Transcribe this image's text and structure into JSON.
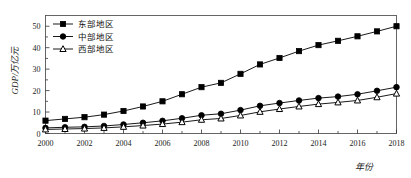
{
  "chart_data": {
    "type": "line",
    "title": "",
    "xlabel": "年份",
    "ylabel": "GDP/万亿元",
    "x": [
      2000,
      2001,
      2002,
      2003,
      2004,
      2005,
      2006,
      2007,
      2008,
      2009,
      2010,
      2011,
      2012,
      2013,
      2014,
      2015,
      2016,
      2017,
      2018
    ],
    "xtick_labels": [
      "2000",
      "2002",
      "2004",
      "2006",
      "2008",
      "2010",
      "2012",
      "2014",
      "2016",
      "2018"
    ],
    "xtick_values": [
      2000,
      2002,
      2004,
      2006,
      2008,
      2010,
      2012,
      2014,
      2016,
      2018
    ],
    "ytick_labels": [
      "0",
      "10",
      "20",
      "30",
      "40",
      "50"
    ],
    "ytick_values": [
      0,
      10,
      20,
      30,
      40,
      50
    ],
    "xlim": [
      2000,
      2018
    ],
    "ylim": [
      0,
      55
    ],
    "grid": false,
    "legend_position": "top-left",
    "series": [
      {
        "name": "东部地区",
        "marker": "square",
        "color": "#000000",
        "values": [
          6.0,
          6.8,
          7.6,
          8.8,
          10.5,
          12.6,
          15.0,
          18.3,
          21.6,
          23.6,
          27.8,
          32.2,
          35.2,
          38.4,
          41.2,
          43.2,
          45.3,
          47.6,
          50.0
        ]
      },
      {
        "name": "中部地区",
        "marker": "circle",
        "color": "#000000",
        "values": [
          2.6,
          2.9,
          3.1,
          3.5,
          4.2,
          5.0,
          5.9,
          7.1,
          8.5,
          9.2,
          10.9,
          12.9,
          14.2,
          15.4,
          16.5,
          17.2,
          18.3,
          19.9,
          21.6
        ]
      },
      {
        "name": "西部地区",
        "marker": "triangle",
        "color": "#000000",
        "values": [
          1.9,
          2.1,
          2.3,
          2.6,
          3.1,
          3.7,
          4.4,
          5.3,
          6.4,
          7.0,
          8.4,
          10.1,
          11.4,
          12.6,
          13.7,
          14.5,
          15.4,
          16.9,
          18.6
        ]
      }
    ]
  },
  "axes": {
    "y_title": "GDP/万亿元",
    "x_title": "年份"
  }
}
